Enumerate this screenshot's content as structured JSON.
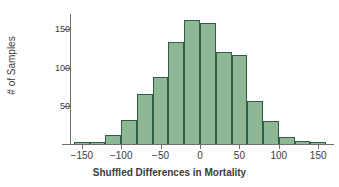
{
  "chart_data": {
    "type": "bar",
    "title": "",
    "subtitle": "",
    "xlabel": "Shuffled Differences in Mortality",
    "ylabel": "# of Samples",
    "grid": false,
    "legend": null,
    "xlim": [
      -165,
      165
    ],
    "ylim": [
      0,
      170
    ],
    "bin_width": 20,
    "xticks": [
      -150,
      -100,
      -50,
      0,
      50,
      100,
      150
    ],
    "xtick_labels": [
      "−150",
      "−100",
      "−50",
      "0",
      "50",
      "100",
      "150"
    ],
    "yticks": [
      50,
      100,
      150
    ],
    "ytick_labels": [
      "50",
      "100",
      "150"
    ],
    "bar_fill_color": "#8db795",
    "bar_edge_color": "#2f5f42",
    "axis_color": "#6f6f6f",
    "background_color": "#ffffff",
    "bins": [
      {
        "left": -160,
        "right": -140,
        "center": -150,
        "value": 2
      },
      {
        "left": -140,
        "right": -120,
        "center": -130,
        "value": 2
      },
      {
        "left": -120,
        "right": -100,
        "center": -110,
        "value": 12
      },
      {
        "left": -100,
        "right": -80,
        "center": -90,
        "value": 31
      },
      {
        "left": -80,
        "right": -60,
        "center": -70,
        "value": 65
      },
      {
        "left": -60,
        "right": -40,
        "center": -50,
        "value": 88
      },
      {
        "left": -40,
        "right": -20,
        "center": -30,
        "value": 133
      },
      {
        "left": -20,
        "right": 0,
        "center": -10,
        "value": 162
      },
      {
        "left": 0,
        "right": 20,
        "center": 10,
        "value": 158
      },
      {
        "left": 20,
        "right": 40,
        "center": 30,
        "value": 120
      },
      {
        "left": 40,
        "right": 60,
        "center": 50,
        "value": 116
      },
      {
        "left": 60,
        "right": 80,
        "center": 70,
        "value": 56
      },
      {
        "left": 80,
        "right": 100,
        "center": 90,
        "value": 30
      },
      {
        "left": 100,
        "right": 120,
        "center": 110,
        "value": 9
      },
      {
        "left": 120,
        "right": 140,
        "center": 130,
        "value": 4
      },
      {
        "left": 140,
        "right": 160,
        "center": 150,
        "value": 2
      }
    ],
    "categories": [
      -150,
      -130,
      -110,
      -90,
      -70,
      -50,
      -30,
      -10,
      10,
      30,
      50,
      70,
      90,
      110,
      130,
      150
    ],
    "values": [
      2,
      2,
      12,
      31,
      65,
      88,
      133,
      162,
      158,
      120,
      116,
      56,
      30,
      9,
      4,
      2
    ]
  }
}
